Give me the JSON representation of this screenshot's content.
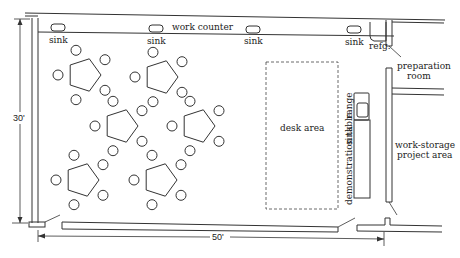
{
  "dimensions": {
    "height": "30'",
    "width": "50'"
  },
  "labels": {
    "work_counter": "work counter",
    "sink": "sink",
    "refrigerator": "refg.",
    "preparation_room_line1": "preparation",
    "preparation_room_line2": "room",
    "desk_area": "desk area",
    "demonstration_table": "demonstration table",
    "demo_sink": "sink",
    "range": "range",
    "work_storage_line1": "work-storage",
    "work_storage_line2": "project area"
  },
  "counter_sinks": [
    {
      "label": "sink",
      "x": 58
    },
    {
      "label": "sink",
      "x": 156
    },
    {
      "label": "sink",
      "x": 253
    },
    {
      "label": "sink",
      "x": 353
    }
  ],
  "tables": [
    {
      "id": "table-1",
      "shape": "pentagon",
      "seats": 5,
      "cx": 84,
      "cy": 75
    },
    {
      "id": "table-2",
      "shape": "pentagon",
      "seats": 5,
      "cx": 161,
      "cy": 77
    },
    {
      "id": "table-3",
      "shape": "pentagon",
      "seats": 5,
      "cx": 121,
      "cy": 126
    },
    {
      "id": "table-4",
      "shape": "pentagon",
      "seats": 5,
      "cx": 198,
      "cy": 126
    },
    {
      "id": "table-5",
      "shape": "pentagon",
      "seats": 5,
      "cx": 82,
      "cy": 180
    },
    {
      "id": "table-6",
      "shape": "pentagon",
      "seats": 5,
      "cx": 160,
      "cy": 180
    }
  ]
}
